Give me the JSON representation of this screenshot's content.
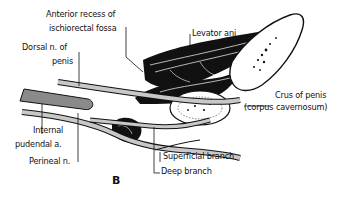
{
  "figure": {
    "panel_label": "B",
    "labels": {
      "anterior_recess_line1": "Anterior recess of",
      "anterior_recess_line2": "ischiorectal fossa",
      "levator_ani": "Levator ani",
      "dorsal_nerve_line1": "Dorsal n. of",
      "dorsal_nerve_line2": "penis",
      "crus_line1": "Crus of penis",
      "crus_line2": "(corpus cavernosum)",
      "internal_pudendal_line1": "Internal",
      "internal_pudendal_line2": "pudendal a.",
      "perineal_nerve": "Perineal n.",
      "superficial_branch": "Superficial branch",
      "deep_branch": "Deep branch"
    },
    "colors": {
      "ink": "#111111",
      "vessel_gray": "#8a8a8a",
      "nerve_gray": "#c8c8c8",
      "background": "#ffffff"
    }
  }
}
